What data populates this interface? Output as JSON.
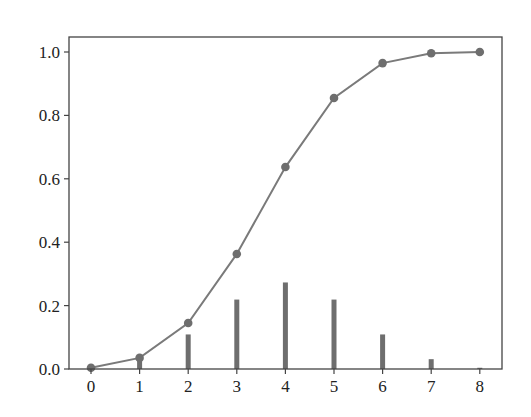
{
  "chart_data": {
    "type": "bar+line",
    "title": "",
    "xlabel": "",
    "ylabel": "",
    "x": [
      0,
      1,
      2,
      3,
      4,
      5,
      6,
      7,
      8
    ],
    "series": [
      {
        "name": "pmf",
        "type": "bar",
        "values": [
          0.0039,
          0.031,
          0.109,
          0.219,
          0.273,
          0.219,
          0.109,
          0.031,
          0.0039
        ]
      },
      {
        "name": "cdf",
        "type": "line",
        "marker": "circle",
        "values": [
          0.004,
          0.035,
          0.145,
          0.363,
          0.637,
          0.855,
          0.965,
          0.996,
          1.0
        ]
      }
    ],
    "xticks": [
      "0",
      "1",
      "2",
      "3",
      "4",
      "5",
      "6",
      "7",
      "8"
    ],
    "yticks": [
      "0.0",
      "0.2",
      "0.4",
      "0.6",
      "0.8",
      "1.0"
    ],
    "xlim": [
      -0.45,
      8.45
    ],
    "ylim": [
      0.0,
      1.05
    ],
    "grid": false,
    "legend": null,
    "colors": {
      "bar": "#6e6e6e",
      "line": "#7a7a7a",
      "marker": "#6e6e6e",
      "axis": "#444444"
    }
  }
}
